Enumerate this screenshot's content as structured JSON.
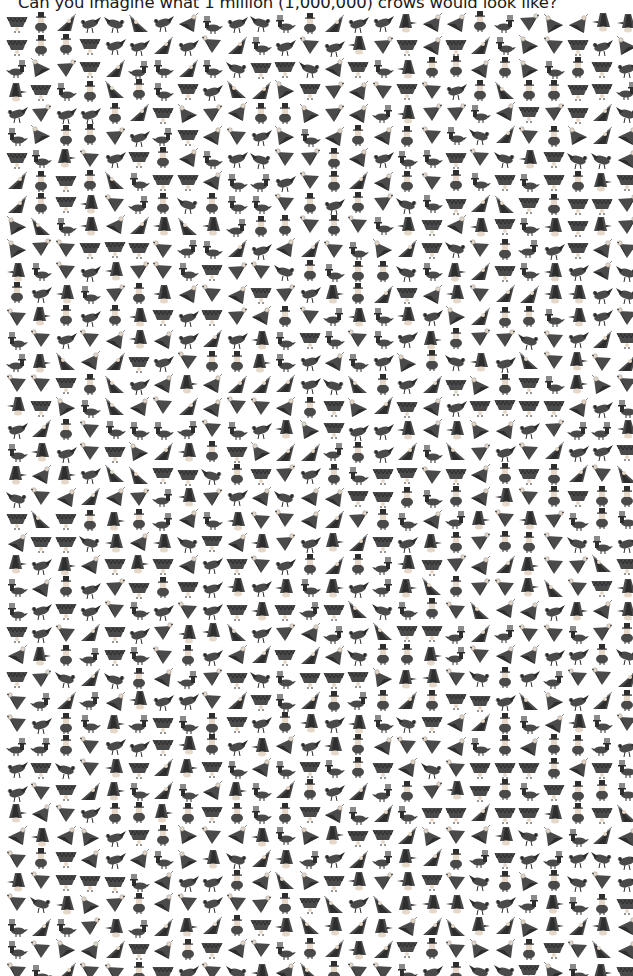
{
  "title": "Can you imagine what 1 million (1,000,000) crows would look like?",
  "grid": {
    "rows": 43,
    "columns": 26,
    "icon": "crow-icon",
    "poses": [
      "crow-triangle-down",
      "crow-diagonal-wing",
      "crow-top-hat-duck",
      "crow-triangle-left",
      "crow-wing-up",
      "crow-spread-wings",
      "crow-walking",
      "crow-bust-top-hat"
    ],
    "colors": {
      "body": "#4a4a4a",
      "dark": "#2e2e2e",
      "light": "#8a8a8a",
      "skin": "#e6d8c8",
      "background": "#ffffff"
    }
  }
}
